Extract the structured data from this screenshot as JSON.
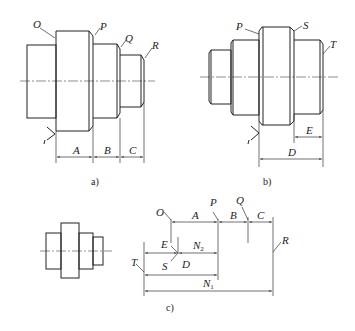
{
  "figure": {
    "subfigures": [
      {
        "id": "a",
        "caption": "a)",
        "surface_labels": [
          "O",
          "P",
          "Q",
          "R"
        ],
        "dimension_labels": [
          "A",
          "B",
          "C"
        ]
      },
      {
        "id": "b",
        "caption": "b)",
        "surface_labels": [
          "P",
          "S",
          "T"
        ],
        "dimension_labels": [
          "E",
          "D"
        ]
      },
      {
        "id": "c",
        "caption": "c)",
        "surface_labels": [
          "O",
          "P",
          "Q",
          "R",
          "E",
          "T",
          "S"
        ],
        "dimension_labels": [
          "A",
          "B",
          "C",
          "D",
          "N2",
          "N1"
        ]
      }
    ]
  },
  "labels": {
    "a": {
      "O": "O",
      "P": "P",
      "Q": "Q",
      "R": "R",
      "A": "A",
      "B": "B",
      "C": "C",
      "caption": "a)"
    },
    "b": {
      "P": "P",
      "S": "S",
      "T": "T",
      "E": "E",
      "D": "D",
      "caption": "b)"
    },
    "c": {
      "O": "O",
      "P": "P",
      "Q": "Q",
      "R": "R",
      "A": "A",
      "B": "B",
      "C": "C",
      "E": "E",
      "T": "T",
      "S": "S",
      "D": "D",
      "N2_main": "N",
      "N2_sub": "2",
      "N1_main": "N",
      "N1_sub": "1",
      "caption": "c)"
    }
  }
}
